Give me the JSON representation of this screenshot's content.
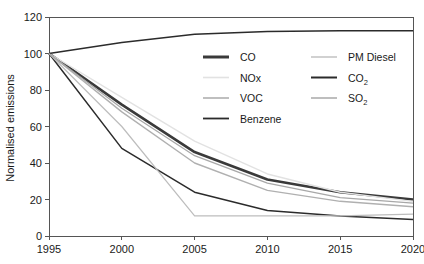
{
  "chart_data": {
    "type": "line",
    "title": "",
    "xlabel": "",
    "ylabel": "Normalised emissions",
    "x": [
      1995,
      2000,
      2005,
      2010,
      2015,
      2020
    ],
    "xlim": [
      1995,
      2020
    ],
    "ylim": [
      0,
      120
    ],
    "xticks": [
      "1995",
      "2000",
      "2005",
      "2010",
      "2015",
      "2020"
    ],
    "yticks": [
      "0",
      "20",
      "40",
      "60",
      "80",
      "100",
      "120"
    ],
    "grid": false,
    "legend_position": "inside-upper-right",
    "series": [
      {
        "name": "CO",
        "color": "#3a3a3a",
        "width": 2.6,
        "values": [
          100,
          72,
          46,
          31,
          24,
          20
        ]
      },
      {
        "name": "NOx",
        "color": "#e2e2e2",
        "width": 1.4,
        "values": [
          100,
          76,
          52,
          34,
          24,
          19
        ]
      },
      {
        "name": "VOC",
        "color": "#b0b0b0",
        "width": 1.4,
        "values": [
          100,
          68,
          40,
          25,
          19,
          16
        ]
      },
      {
        "name": "Benzene",
        "color": "#2b2b2b",
        "width": 1.5,
        "values": [
          100,
          48,
          24,
          14,
          11,
          9
        ]
      },
      {
        "name": "PM Diesel",
        "color": "#bdbdbd",
        "width": 1.2,
        "values": [
          100,
          60,
          11,
          11,
          11,
          12
        ]
      },
      {
        "name": "CO2",
        "color": "#2b2b2b",
        "width": 1.5,
        "values": [
          100,
          106,
          110.5,
          112,
          112.5,
          112.5
        ]
      },
      {
        "name": "SO2",
        "color": "#a8a8a8",
        "width": 1.3,
        "values": [
          100,
          70,
          44,
          29,
          21,
          18
        ]
      }
    ]
  },
  "axes": {
    "y_title": "Normalised emissions",
    "y_ticks": [
      {
        "label": "120",
        "value": 120
      },
      {
        "label": "100",
        "value": 100
      },
      {
        "label": "80",
        "value": 80
      },
      {
        "label": "60",
        "value": 60
      },
      {
        "label": "40",
        "value": 40
      },
      {
        "label": "20",
        "value": 20
      },
      {
        "label": "0",
        "value": 0
      }
    ],
    "x_ticks": [
      {
        "label": "1995",
        "value": 1995
      },
      {
        "label": "2000",
        "value": 2000
      },
      {
        "label": "2005",
        "value": 2005
      },
      {
        "label": "2010",
        "value": 2010
      },
      {
        "label": "2015",
        "value": 2015
      },
      {
        "label": "2020",
        "value": 2020
      }
    ]
  },
  "legend": {
    "columns": [
      {
        "entries": [
          {
            "label": "CO",
            "sub": "",
            "color": "#3a3a3a",
            "width": 3.0
          },
          {
            "label": "NOx",
            "sub": "",
            "color": "#e2e2e2",
            "width": 1.6
          },
          {
            "label": "VOC",
            "sub": "",
            "color": "#b0b0b0",
            "width": 1.6
          },
          {
            "label": "Benzene",
            "sub": "",
            "color": "#2b2b2b",
            "width": 1.8
          }
        ]
      },
      {
        "entries": [
          {
            "label": "PM Diesel",
            "sub": "",
            "color": "#bdbdbd",
            "width": 1.4
          },
          {
            "label": "CO",
            "sub": "2",
            "color": "#2b2b2b",
            "width": 2.0
          },
          {
            "label": "SO",
            "sub": "2",
            "color": "#a8a8a8",
            "width": 1.5
          }
        ]
      }
    ]
  }
}
